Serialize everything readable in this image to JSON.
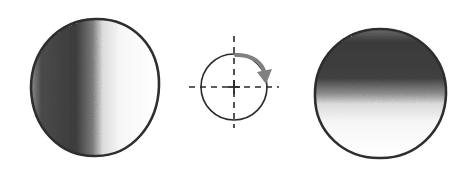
{
  "diagram": {
    "description": "Hand-drawn illustration: sphere shaded left-to-right, rotation symbol, sphere shaded top-to-bottom",
    "left_sphere": {
      "label": "sphere-shaded-horizontally",
      "shade_side": "left",
      "dark_color": "#3a3a3a",
      "light_color": "#ffffff",
      "outline_color": "#2e2e2e"
    },
    "rotation_symbol": {
      "label": "rotation-symbol",
      "arrow_color": "#808080",
      "line_color": "#2a2a2a",
      "direction": "clockwise-90"
    },
    "right_sphere": {
      "label": "sphere-shaded-vertically",
      "shade_side": "top",
      "dark_color": "#333333",
      "light_color": "#ffffff",
      "outline_color": "#2e2e2e"
    }
  }
}
